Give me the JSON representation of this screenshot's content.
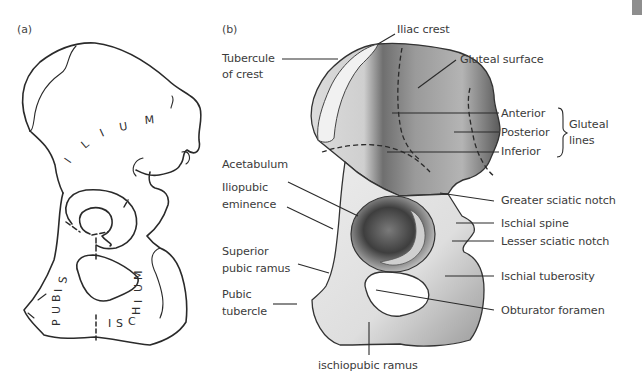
{
  "figure": {
    "panels": [
      {
        "id": "a",
        "tag": "(a)",
        "regions": {
          "ilium": [
            "I",
            "L",
            "I",
            "U",
            "M"
          ],
          "pubis": [
            "P",
            "U",
            "B",
            "I",
            "S"
          ],
          "ischium_bottom": [
            "I",
            "S",
            "C",
            "H"
          ],
          "ischium_side": [
            "I",
            "U",
            "M"
          ]
        }
      },
      {
        "id": "b",
        "tag": "(b)",
        "labels_left": {
          "tubercule_of_crest": [
            "Tubercule",
            "of crest"
          ],
          "acetabulum": "Acetabulum",
          "iliopubic_eminence": [
            "Iliopubic",
            "eminence"
          ],
          "superior_pubic_ramus": [
            "Superior",
            "pubic ramus"
          ],
          "pubic_tubercle": [
            "Pubic",
            "tubercle"
          ]
        },
        "labels_top": {
          "iliac_crest": "Iliac crest",
          "gluteal_surface": "Gluteal surface"
        },
        "labels_right": {
          "anterior": "Anterior",
          "posterior": "Posterior",
          "inferior": "Inferior",
          "gluteal_lines": [
            "Gluteal",
            "lines"
          ],
          "greater_sciatic_notch": "Greater sciatic notch",
          "ischial_spine": "Ischial spine",
          "lesser_sciatic_notch": "Lesser sciatic notch",
          "ischial_tuberosity": "Ischial tuberosity",
          "obturator_foramen": "Obturator foramen"
        },
        "labels_bottom": {
          "ischiopubic_ramus": "ischiopubic ramus"
        }
      }
    ]
  },
  "colors": {
    "ink": "#2a2a2a",
    "label_text": "#3b3b3b",
    "bone_light": "#e6e6e6",
    "bone_mid": "#b8b8b8",
    "bone_dark": "#6e6e6e",
    "corner_block": "#8e8e8e"
  }
}
